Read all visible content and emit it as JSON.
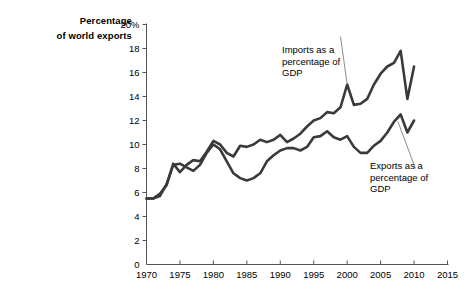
{
  "axis_title": {
    "line1": "Percentage",
    "line2": "of world exports"
  },
  "annotations": {
    "imports": {
      "line1": "Imports as a",
      "line2": "percentage of",
      "line3": "GDP"
    },
    "exports": {
      "line1": "Exports as a",
      "line2": "percentage of",
      "line3": "GDP"
    }
  },
  "colors": {
    "line": "#3a3a3a",
    "axis": "#555555",
    "leader": "#8c8c8c",
    "background": "#ffffff"
  },
  "chart_data": {
    "type": "line",
    "title": "",
    "subtitle": "",
    "xlabel": "",
    "ylabel": "Percentage of world exports",
    "xlim": [
      1970,
      2015
    ],
    "ylim": [
      0,
      20
    ],
    "xticks": [
      1970,
      1975,
      1980,
      1985,
      1990,
      1995,
      2000,
      2005,
      2010,
      2015
    ],
    "yticks": [
      0,
      2,
      4,
      6,
      8,
      10,
      12,
      14,
      16,
      18,
      20
    ],
    "ytick_labels": [
      "0",
      "2",
      "4",
      "6",
      "8",
      "10",
      "12",
      "14",
      "16",
      "18",
      "20%"
    ],
    "grid": false,
    "legend": "annotations",
    "x": [
      1970,
      1971,
      1972,
      1973,
      1974,
      1975,
      1976,
      1977,
      1978,
      1979,
      1980,
      1981,
      1982,
      1983,
      1984,
      1985,
      1986,
      1987,
      1988,
      1989,
      1990,
      1991,
      1992,
      1993,
      1994,
      1995,
      1996,
      1997,
      1998,
      1999,
      2000,
      2001,
      2002,
      2003,
      2004,
      2005,
      2006,
      2007,
      2008,
      2009,
      2010
    ],
    "series": [
      {
        "name": "Imports as a percentage of GDP",
        "values": [
          5.5,
          5.5,
          5.9,
          6.6,
          8.4,
          7.7,
          8.3,
          8.7,
          8.6,
          9.4,
          10.3,
          10.0,
          9.3,
          9.0,
          9.9,
          9.8,
          10.0,
          10.4,
          10.2,
          10.4,
          10.8,
          10.2,
          10.5,
          10.9,
          11.5,
          12.0,
          12.2,
          12.7,
          12.6,
          13.1,
          15.0,
          13.3,
          13.4,
          13.8,
          15.0,
          15.9,
          16.5,
          16.8,
          17.8,
          13.8,
          16.5
        ]
      },
      {
        "name": "Exports as a percentage of GDP",
        "values": [
          5.5,
          5.5,
          5.7,
          6.7,
          8.3,
          8.4,
          8.1,
          7.8,
          8.3,
          9.3,
          10.0,
          9.6,
          8.6,
          7.6,
          7.2,
          7.0,
          7.2,
          7.6,
          8.6,
          9.1,
          9.5,
          9.7,
          9.7,
          9.5,
          9.8,
          10.6,
          10.7,
          11.1,
          10.6,
          10.4,
          10.7,
          9.8,
          9.3,
          9.3,
          9.9,
          10.3,
          11.0,
          11.9,
          12.5,
          11.0,
          12.0
        ]
      }
    ]
  }
}
